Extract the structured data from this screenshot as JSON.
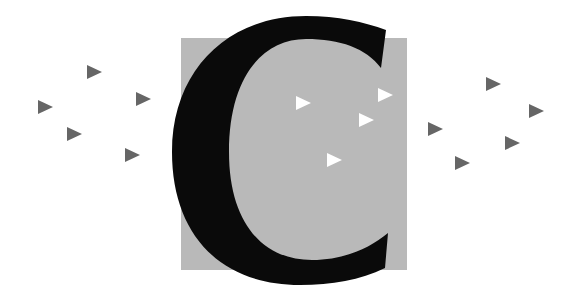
{
  "illustration": {
    "letter": "C",
    "colors": {
      "background": "#ffffff",
      "square": "#b9b9b9",
      "letter": "#0a0a0a",
      "outer_triangle": "#666666",
      "inner_triangle": "#ffffff"
    },
    "square": {
      "x": 181,
      "y": 38,
      "width": 226,
      "height": 232
    },
    "triangles_left": [
      {
        "x": 87,
        "y": 65
      },
      {
        "x": 38,
        "y": 100
      },
      {
        "x": 136,
        "y": 92
      },
      {
        "x": 67,
        "y": 127
      },
      {
        "x": 125,
        "y": 148
      }
    ],
    "triangles_right": [
      {
        "x": 486,
        "y": 77
      },
      {
        "x": 529,
        "y": 104
      },
      {
        "x": 428,
        "y": 122
      },
      {
        "x": 505,
        "y": 136
      },
      {
        "x": 455,
        "y": 156
      }
    ],
    "triangles_inner": [
      {
        "x": 296,
        "y": 96
      },
      {
        "x": 378,
        "y": 88
      },
      {
        "x": 359,
        "y": 113
      },
      {
        "x": 327,
        "y": 153
      }
    ]
  }
}
